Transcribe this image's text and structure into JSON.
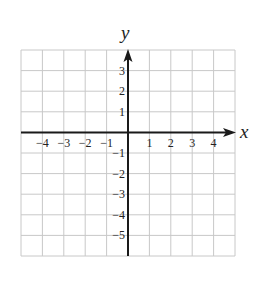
{
  "chart_data": {
    "type": "line",
    "title": "",
    "xlabel": "x",
    "ylabel": "y",
    "xlim": [
      -5,
      5
    ],
    "ylim": [
      -6,
      4
    ],
    "x_ticks": [
      -4,
      -3,
      -2,
      -1,
      1,
      2,
      3,
      4
    ],
    "x_tick_labels": [
      "−4",
      "−3",
      "−2",
      "−1",
      "1",
      "2",
      "3",
      "4"
    ],
    "y_ticks": [
      3,
      2,
      1,
      -1,
      -2,
      -3,
      -4,
      -5
    ],
    "y_tick_labels": [
      "3",
      "2",
      "1",
      "−1",
      "−2",
      "−3",
      "−4",
      "−5"
    ],
    "grid": true,
    "series": [],
    "colors": {
      "grid": "#c8c8c8",
      "axis": "#1a1a1a",
      "text": "#222222"
    }
  }
}
